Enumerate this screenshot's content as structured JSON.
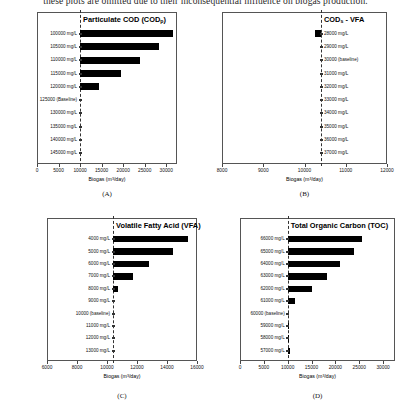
{
  "header_text": "these plots are omitted due to their inconsequential influence on biogas production.",
  "axis_title": "Biogas (m³/day)",
  "chart_data": [
    {
      "id": "A",
      "type": "bar",
      "orientation": "horizontal",
      "panel_letter": "(A)",
      "title": "Particulate COD (CODp)",
      "title_main": "Particulate COD (COD",
      "title_sub": "p",
      "title_tail": ")",
      "xlabel": "Biogas (m³/day)",
      "ylabel": "",
      "xlim": [
        0,
        32500
      ],
      "xticks": [
        0,
        5000,
        10000,
        15000,
        20000,
        25000,
        30000
      ],
      "xticklabels": [
        "0",
        "5000",
        "10000",
        "15000",
        "20000",
        "25000",
        "30000"
      ],
      "baseline_value": 10000,
      "baseline_category": "125000 (Baseline)",
      "label_side": "left",
      "grid": false,
      "categories": [
        "100000 mg/L",
        "105000 mg/L",
        "110000 mg/L",
        "115000 mg/L",
        "120000 mg/L",
        "125000 (Baseline)",
        "130000 mg/L",
        "135000 mg/L",
        "140000 mg/L",
        "145000 mg/L"
      ],
      "values": [
        31500,
        28300,
        24000,
        19500,
        14400,
        10000,
        10000,
        10000,
        10000,
        10000
      ]
    },
    {
      "id": "B",
      "type": "bar",
      "orientation": "horizontal",
      "panel_letter": "(B)",
      "title": "CODs - VFA",
      "title_main": "COD",
      "title_sub": "s",
      "title_tail": " - VFA",
      "xlabel": "Biogas (m³/day)",
      "ylabel": "",
      "xlim": [
        8000,
        12000
      ],
      "xticks": [
        8000,
        9000,
        10000,
        11000,
        12000
      ],
      "xticklabels": [
        "8000",
        "9000",
        "10000",
        "11000",
        "12000"
      ],
      "baseline_value": 10400,
      "baseline_category": "30000 (baseline)",
      "label_side": "right",
      "grid": false,
      "categories": [
        "28000 mg/L",
        "29000 mg/L",
        "30000 (baseline)",
        "31000 mg/L",
        "32000 mg/L",
        "33000 mg/L",
        "34000 mg/L",
        "35000 mg/L",
        "36000 mg/L",
        "37000 mg/L"
      ],
      "values": [
        10250,
        10400,
        10400,
        10400,
        10400,
        10400,
        10400,
        10400,
        10400,
        10400
      ]
    },
    {
      "id": "C",
      "type": "bar",
      "orientation": "horizontal",
      "panel_letter": "(C)",
      "title": "Volatile Fatty Acid (VFA)",
      "title_main": "Volatile Fatty Acid (VFA)",
      "title_sub": "",
      "title_tail": "",
      "xlabel": "Biogas (m³/day)",
      "ylabel": "",
      "xlim": [
        6000,
        16000
      ],
      "xticks": [
        6000,
        8000,
        10000,
        12000,
        14000,
        16000
      ],
      "xticklabels": [
        "6000",
        "8000",
        "10000",
        "12000",
        "14000",
        "16000"
      ],
      "baseline_value": 10400,
      "baseline_category": "10000 (baseline)",
      "label_side": "left",
      "grid": false,
      "categories": [
        "4000 mg/L",
        "5000 mg/L",
        "6000 mg/L",
        "7000 mg/L",
        "8000 mg/L",
        "9000 mg/L",
        "10000 (baseline)",
        "11000 mg/L",
        "12000 mg/L",
        "13000 mg/L"
      ],
      "values": [
        15400,
        14400,
        12800,
        11700,
        10700,
        10400,
        10400,
        10400,
        10400,
        10400
      ]
    },
    {
      "id": "D",
      "type": "bar",
      "orientation": "horizontal",
      "panel_letter": "(D)",
      "title": "Total Organic Carbon (TOC)",
      "title_main": "Total Organic Carbon (TOC)",
      "title_sub": "",
      "title_tail": "",
      "xlabel": "Biogas (m³/day)",
      "ylabel": "",
      "xlim": [
        0,
        32500
      ],
      "xticks": [
        0,
        5000,
        10000,
        15000,
        20000,
        25000,
        30000
      ],
      "xticklabels": [
        "0",
        "5000",
        "10000",
        "15000",
        "20000",
        "25000",
        "30000"
      ],
      "baseline_value": 10000,
      "baseline_category": "60000 (baseline)",
      "label_side": "left",
      "grid": false,
      "categories": [
        "66000 mg/L",
        "65000 mg/L",
        "64000 mg/L",
        "63000 mg/L",
        "62000 mg/L",
        "61000 mg/L",
        "60000 (baseline)",
        "59000 mg/L",
        "58000 mg/L",
        "57000 mg/L"
      ],
      "values": [
        25500,
        24000,
        21000,
        18200,
        15000,
        11500,
        10000,
        10300,
        10350,
        10500
      ]
    }
  ]
}
